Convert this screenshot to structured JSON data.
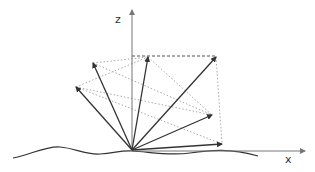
{
  "diagram": {
    "type": "vector-fan-3d",
    "axes": {
      "z_label": "z",
      "x_label": "x"
    },
    "origin": [
      132,
      150
    ],
    "vectors": [
      {
        "id": "v1",
        "tip": [
          76,
          87
        ]
      },
      {
        "id": "v2",
        "tip": [
          93,
          63
        ]
      },
      {
        "id": "v3",
        "tip": [
          148,
          57
        ]
      },
      {
        "id": "v4",
        "tip": [
          216,
          57
        ]
      },
      {
        "id": "v5",
        "tip": [
          212,
          115
        ]
      },
      {
        "id": "v6",
        "tip": [
          222,
          144
        ]
      }
    ],
    "colors": {
      "vector": "#333333",
      "axis": "#777777",
      "dotted": "#aaaaaa",
      "curve": "#333333"
    }
  }
}
